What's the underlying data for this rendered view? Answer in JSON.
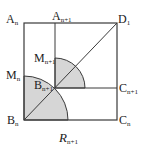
{
  "diagram": {
    "caption": "R",
    "caption_sub": "n+1",
    "colors": {
      "line": "#3a3a3a",
      "shade": "#d6d6d6",
      "background": "#ffffff"
    },
    "labels": {
      "A_n": {
        "main": "A",
        "sub": "n"
      },
      "A_n1": {
        "main": "A",
        "sub": "n+1"
      },
      "D_1": {
        "main": "D",
        "sub": "1"
      },
      "M_n1": {
        "main": "M",
        "sub": "n+1"
      },
      "M_n": {
        "main": "M",
        "sub": "n"
      },
      "B_n1": {
        "main": "B",
        "sub": "n+1"
      },
      "C_n1": {
        "main": "C",
        "sub": "n+1"
      },
      "B_n": {
        "main": "B",
        "sub": "n"
      },
      "C_n": {
        "main": "C",
        "sub": "n"
      }
    }
  }
}
